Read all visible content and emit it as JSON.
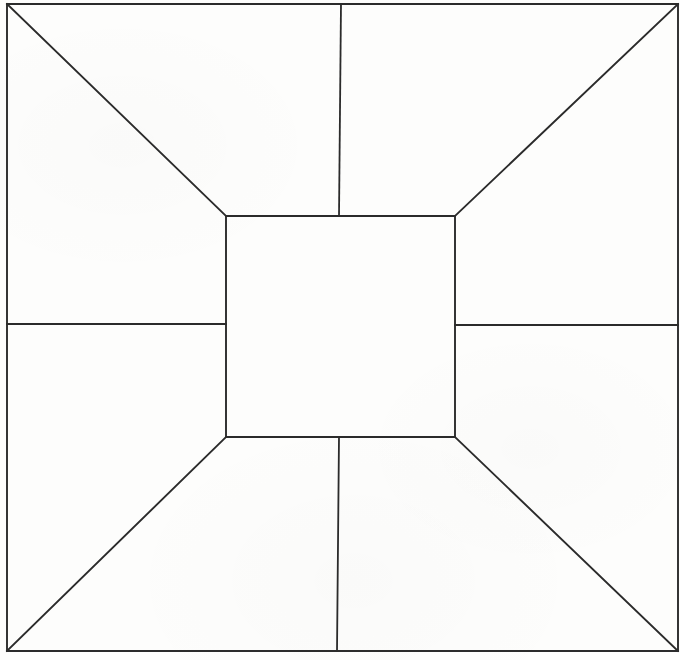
{
  "canvas": {
    "width": 680,
    "height": 660,
    "background_color": "#fdfdfc",
    "line_color": "#2b2b2b",
    "line_width": 1.9
  },
  "figure": {
    "shapes": [
      {
        "name": "outer-rectangle",
        "type": "rect",
        "x1": 7,
        "y1": 4,
        "x2": 678,
        "y2": 651
      },
      {
        "name": "inner-rectangle",
        "type": "rect",
        "x1": 226,
        "y1": 216,
        "x2": 455,
        "y2": 437
      }
    ],
    "diagonals": [
      {
        "name": "diagonal-top-left",
        "x1": 7,
        "y1": 4,
        "x2": 226,
        "y2": 216
      },
      {
        "name": "diagonal-top-right",
        "x1": 678,
        "y1": 4,
        "x2": 455,
        "y2": 216
      },
      {
        "name": "diagonal-bottom-left",
        "x1": 7,
        "y1": 651,
        "x2": 226,
        "y2": 437
      },
      {
        "name": "diagonal-bottom-right",
        "x1": 678,
        "y1": 651,
        "x2": 455,
        "y2": 437
      }
    ],
    "dividers": [
      {
        "name": "divider-top",
        "orientation": "vertical",
        "x1": 341,
        "y1": 4,
        "x2": 339,
        "y2": 216
      },
      {
        "name": "divider-bottom",
        "orientation": "vertical",
        "x1": 339,
        "y1": 437,
        "x2": 337,
        "y2": 651
      },
      {
        "name": "divider-left",
        "orientation": "horizontal",
        "x1": 7,
        "y1": 324,
        "x2": 226,
        "y2": 324
      },
      {
        "name": "divider-right",
        "orientation": "horizontal",
        "x1": 455,
        "y1": 325,
        "x2": 678,
        "y2": 325
      }
    ],
    "faces": [
      {
        "name": "face-center",
        "label": ""
      },
      {
        "name": "face-top",
        "label": ""
      },
      {
        "name": "face-bottom",
        "label": ""
      },
      {
        "name": "face-left",
        "label": ""
      },
      {
        "name": "face-right",
        "label": ""
      }
    ]
  }
}
